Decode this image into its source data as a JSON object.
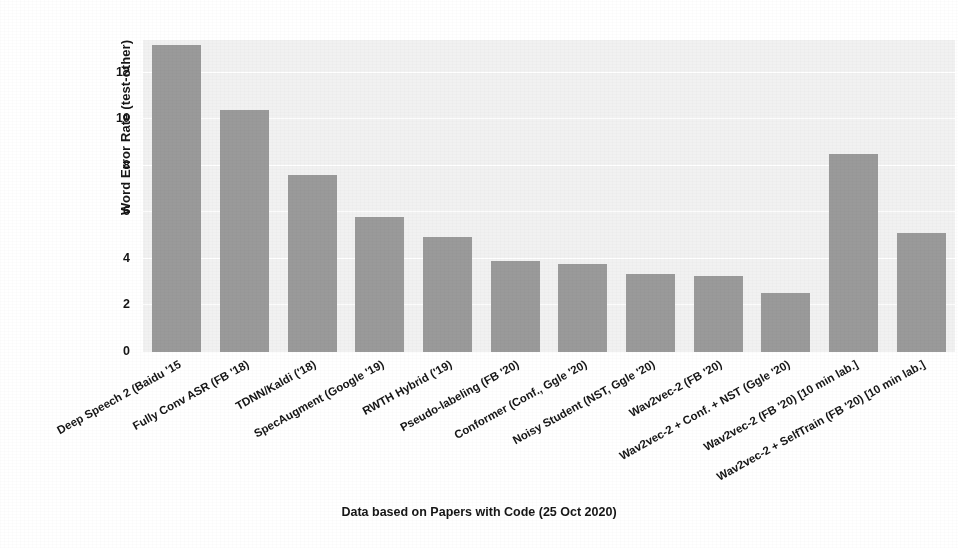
{
  "figure": {
    "y_axis_title": "Word Error Rate (test-other)",
    "caption": "Data based on Papers with Code (25 Oct 2020)",
    "bar_color": "#9a9a9a",
    "panel_color": "#f1f1f1",
    "grid_color": "#ffffff"
  },
  "chart_data": {
    "type": "bar",
    "title": "",
    "subtitle": "",
    "xlabel": "",
    "ylabel": "Word Error Rate (test-other)",
    "annotation": "Data based on Papers with Code (25 Oct 2020)",
    "ylim": [
      0,
      13.4
    ],
    "yticks": [
      0,
      2,
      4,
      6,
      8,
      10,
      12
    ],
    "ytick_labels": [
      "0",
      "2",
      "4",
      "6",
      "8",
      "10",
      "12"
    ],
    "grid": true,
    "grid_axis": "y",
    "legend": false,
    "legend_position": "none",
    "orientation": "vertical",
    "categories": [
      "Deep Speech 2 (Baidu '15",
      "Fully Conv ASR (FB '18)",
      "TDNN/Kaldi ('18)",
      "SpecAugment (Google '19)",
      "RWTH Hybrid ('19)",
      "Pseudo-labeling (FB '20)",
      "Conformer (Conf., Ggle '20)",
      "Noisy Student (NST, Ggle '20)",
      "Wav2vec-2 (FB '20)",
      "Wav2vec-2 + Conf. + NST (Ggle '20)",
      "Wav2vec-2 (FB '20) [10 min lab.]",
      "Wav2vec-2 + SelfTrain (FB '20) [10 min lab.]"
    ],
    "values": [
      13.2,
      10.4,
      7.6,
      5.8,
      4.95,
      3.9,
      3.8,
      3.35,
      3.25,
      2.55,
      8.5,
      5.1
    ]
  }
}
